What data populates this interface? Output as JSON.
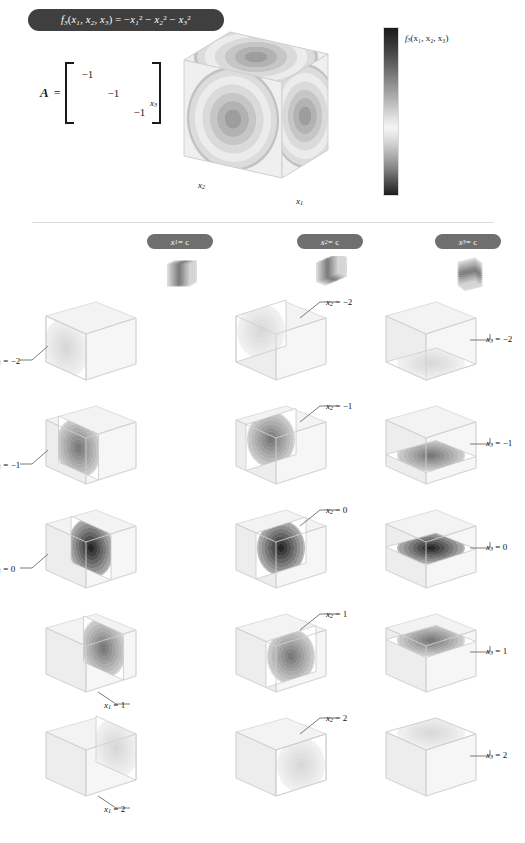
{
  "figure": {
    "title_latex": "f3(x1, x2, x3) = -x1^2 - x2^2 - x3^2",
    "function_name": "f3",
    "variables": [
      "x1",
      "x2",
      "x3"
    ],
    "background_color": "#ffffff",
    "pill_color": "#3f3f3f",
    "header_pill_color": "#6f6f6f"
  },
  "title": {
    "fn": "f",
    "fn_sub": "3",
    "args_open": "(",
    "arg1": "x",
    "arg1_sub": "1",
    "comma1": ", ",
    "arg2": "x",
    "arg2_sub": "2",
    "comma2": ", ",
    "arg3": "x",
    "arg3_sub": "3",
    "args_close": ")",
    "equals": " = ",
    "term1_sign": "−",
    "term1_var": "x",
    "term1_sub": "1",
    "term1_pow": "2",
    "term2_sign": " − ",
    "term2_var": "x",
    "term2_sub": "2",
    "term2_pow": "2",
    "term3_sign": " − ",
    "term3_var": "x",
    "term3_sub": "3",
    "term3_pow": "2"
  },
  "matrix": {
    "label": "A",
    "equals": "=",
    "rows": [
      [
        "−1",
        "",
        ""
      ],
      [
        "",
        "−1",
        ""
      ],
      [
        "",
        "",
        "−1"
      ]
    ]
  },
  "hero": {
    "axis_x1": "x",
    "axis_x1_sub": "1",
    "axis_x2": "x",
    "axis_x2_sub": "2",
    "axis_x3": "x",
    "axis_x3_sub": "3"
  },
  "colorbar": {
    "label_fn": "f",
    "label_sub": "3",
    "label_args": "(x₁, x₂, x₃)",
    "orientation": "vertical",
    "colormap": "diverging-gray",
    "top_color": "#1a1a1a",
    "mid_color": "#f4f4f4",
    "bottom_color": "#1c1c1c"
  },
  "columns": [
    {
      "id": "col-x1",
      "header_var": "x",
      "header_sub": "1",
      "header_eq": " = c",
      "slice_axis": "x1",
      "icon": "stacked-vertical-planes-icon"
    },
    {
      "id": "col-x2",
      "header_var": "x",
      "header_sub": "2",
      "header_eq": " = c",
      "slice_axis": "x2",
      "icon": "stacked-depth-planes-icon"
    },
    {
      "id": "col-x3",
      "header_var": "x",
      "header_sub": "3",
      "header_eq": " = c",
      "slice_axis": "x3",
      "icon": "stacked-horizontal-planes-icon"
    }
  ],
  "c_values": [
    "−2",
    "−1",
    "0",
    "1",
    "2"
  ],
  "cells": [
    {
      "col": 0,
      "row": 0,
      "var": "x",
      "sub": "1",
      "value": "−2",
      "caption": "x₁ = −2",
      "intensity": 0.18,
      "leader": "bottom-left"
    },
    {
      "col": 0,
      "row": 1,
      "var": "x",
      "sub": "1",
      "value": "−1",
      "caption": "x₁ = −1",
      "intensity": 0.62,
      "leader": "bottom-left"
    },
    {
      "col": 0,
      "row": 2,
      "var": "x",
      "sub": "1",
      "value": "0",
      "caption": "x₁ = 0",
      "intensity": 1.0,
      "leader": "bottom-left"
    },
    {
      "col": 0,
      "row": 3,
      "var": "x",
      "sub": "1",
      "value": "1",
      "caption": "x₁ = 1",
      "intensity": 0.62,
      "leader": "bottom-right"
    },
    {
      "col": 0,
      "row": 4,
      "var": "x",
      "sub": "1",
      "value": "2",
      "caption": "x₁ = 2",
      "intensity": 0.18,
      "leader": "bottom-right"
    },
    {
      "col": 1,
      "row": 0,
      "var": "x",
      "sub": "2",
      "value": "−2",
      "caption": "x₂ = −2",
      "intensity": 0.18,
      "leader": "top-right"
    },
    {
      "col": 1,
      "row": 1,
      "var": "x",
      "sub": "2",
      "value": "−1",
      "caption": "x₂ = −1",
      "intensity": 0.62,
      "leader": "top-right"
    },
    {
      "col": 1,
      "row": 2,
      "var": "x",
      "sub": "2",
      "value": "0",
      "caption": "x₂ = 0",
      "intensity": 1.0,
      "leader": "top-right"
    },
    {
      "col": 1,
      "row": 3,
      "var": "x",
      "sub": "2",
      "value": "1",
      "caption": "x₂ = 1",
      "intensity": 0.62,
      "leader": "top-right"
    },
    {
      "col": 1,
      "row": 4,
      "var": "x",
      "sub": "2",
      "value": "2",
      "caption": "x₂ = 2",
      "intensity": 0.18,
      "leader": "top-right"
    },
    {
      "col": 2,
      "row": 0,
      "var": "x",
      "sub": "3",
      "value": "−2",
      "caption": "x₃ = −2",
      "intensity": 0.18,
      "leader": "right"
    },
    {
      "col": 2,
      "row": 1,
      "var": "x",
      "sub": "3",
      "value": "−1",
      "caption": "x₃ = −1",
      "intensity": 0.62,
      "leader": "right"
    },
    {
      "col": 2,
      "row": 2,
      "var": "x",
      "sub": "3",
      "value": "0",
      "caption": "x₃ = 0",
      "intensity": 1.0,
      "leader": "right"
    },
    {
      "col": 2,
      "row": 3,
      "var": "x",
      "sub": "3",
      "value": "1",
      "caption": "x₃ = 1",
      "intensity": 0.62,
      "leader": "right"
    },
    {
      "col": 2,
      "row": 4,
      "var": "x",
      "sub": "3",
      "value": "2",
      "caption": "x₃ = 2",
      "intensity": 0.18,
      "leader": "right"
    }
  ],
  "chart_data": {
    "type": "heatmap",
    "xlabel": "x1",
    "ylabel": "x2",
    "zlabel": "x3",
    "xlim": [
      -2,
      2
    ],
    "ylim": [
      -2,
      2
    ],
    "zlim": [
      -2,
      2
    ],
    "matrix_A": [
      [
        -1,
        0,
        0
      ],
      [
        0,
        -1,
        0
      ],
      [
        0,
        0,
        -1
      ]
    ],
    "eigenvalues": [
      -1,
      -1,
      -1
    ],
    "colormap": "diverging-gray",
    "colorbar_label": "f3(x1, x2, x3)",
    "value_at_origin": 0,
    "value_range": [
      -12,
      0
    ],
    "slice_values": [
      -2,
      -1,
      0,
      1,
      2
    ],
    "legend_position": "right",
    "grid": false,
    "series": [
      {
        "name": "x1 = c slices",
        "values": [
          -2,
          -1,
          0,
          1,
          2
        ]
      },
      {
        "name": "x2 = c slices",
        "values": [
          -2,
          -1,
          0,
          1,
          2
        ]
      },
      {
        "name": "x3 = c slices",
        "values": [
          -2,
          -1,
          0,
          1,
          2
        ]
      }
    ]
  }
}
